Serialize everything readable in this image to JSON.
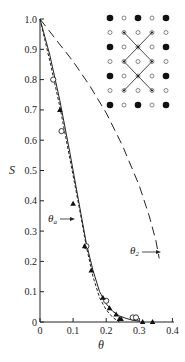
{
  "chart_data": {
    "type": "line",
    "title": "",
    "xlabel": "θ",
    "ylabel": "S",
    "xlim": [
      0,
      0.42
    ],
    "ylim": [
      0,
      1.0
    ],
    "grid": false,
    "x_ticks": [
      "0",
      "0.1",
      "0.2",
      "0.3",
      "0.4"
    ],
    "y_ticks": [
      "0",
      "0.1",
      "0.2",
      "0.3",
      "0.4",
      "0.5",
      "0.6",
      "0.7",
      "0.8",
      "0.9",
      "1.0"
    ],
    "series": [
      {
        "name": "solid curve",
        "style": "solid",
        "x": [
          0,
          0.03,
          0.06,
          0.09,
          0.12,
          0.14,
          0.16,
          0.18,
          0.2,
          0.22,
          0.24,
          0.26,
          0.28,
          0.3
        ],
        "y": [
          1.0,
          0.88,
          0.73,
          0.56,
          0.38,
          0.26,
          0.17,
          0.1,
          0.06,
          0.035,
          0.02,
          0.012,
          0.006,
          0.003
        ]
      },
      {
        "name": "dashed curve (short dash)",
        "style": "short-dash",
        "x": [
          0,
          0.03,
          0.06,
          0.09,
          0.12,
          0.14,
          0.16,
          0.18,
          0.2,
          0.22,
          0.24
        ],
        "y": [
          1.0,
          0.86,
          0.71,
          0.54,
          0.37,
          0.25,
          0.15,
          0.08,
          0.04,
          0.015,
          0.0
        ]
      },
      {
        "name": "long-dash curve (θ_2)",
        "style": "long-dash",
        "x": [
          0,
          0.05,
          0.1,
          0.15,
          0.2,
          0.25,
          0.3,
          0.33,
          0.35,
          0.36
        ],
        "y": [
          1.0,
          0.93,
          0.86,
          0.78,
          0.69,
          0.58,
          0.45,
          0.35,
          0.27,
          0.21
        ]
      },
      {
        "name": "open circles",
        "marker": "open-circle",
        "x": [
          0.04,
          0.065,
          0.14,
          0.2,
          0.28,
          0.29
        ],
        "y": [
          0.8,
          0.63,
          0.25,
          0.07,
          0.015,
          0.015
        ]
      },
      {
        "name": "filled triangles",
        "marker": "filled-triangle",
        "x": [
          0.06,
          0.1,
          0.135,
          0.155,
          0.19,
          0.21,
          0.23,
          0.24,
          0.245,
          0.31,
          0.34
        ],
        "y": [
          0.7,
          0.39,
          0.25,
          0.17,
          0.08,
          0.045,
          0.025,
          0.01,
          0.01,
          0.0,
          0.0
        ]
      }
    ],
    "annotations": [
      {
        "text": "θ_a",
        "points_to": "solid curve",
        "x": 0.1,
        "y": 0.3
      },
      {
        "text": "θ_2",
        "points_to": "long-dash curve",
        "x": 0.36,
        "y": 0.2
      }
    ],
    "inset": {
      "description": "square lattice of large filled and small open circles with zig-zag X lines",
      "rows": 8,
      "cols": 5
    }
  },
  "labels": {
    "y_axis": "S",
    "x_axis": "θ",
    "theta_a": "θ",
    "theta_a_sub": "a",
    "theta_2": "θ",
    "theta_2_sub": "2",
    "x_ticks": [
      "0",
      "0.1",
      "0.2",
      "0.3",
      "0.4"
    ],
    "y_ticks": [
      "0",
      "0.1",
      "0.2",
      "0.3",
      "0.4",
      "0.5",
      "0.6",
      "0.7",
      "0.8",
      "0.9",
      "1.0"
    ]
  }
}
